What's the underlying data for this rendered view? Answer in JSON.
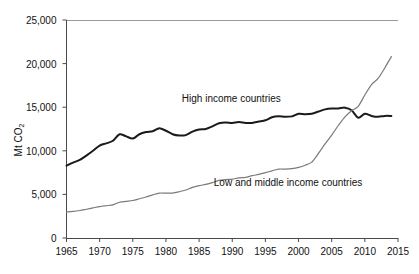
{
  "chart_data": {
    "type": "line",
    "title": "",
    "subtitle": "",
    "xlabel": "",
    "ylabel": "Mt CO",
    "ylabel_sub": "2",
    "xlim": [
      1965,
      2015
    ],
    "ylim": [
      0,
      25000
    ],
    "grid": false,
    "legend_position": "inline-annotations",
    "y_ticks": [
      0,
      5000,
      10000,
      15000,
      20000,
      25000
    ],
    "y_tick_labels": [
      "0",
      "5,000",
      "10,000",
      "15,000",
      "20,000",
      "25,000"
    ],
    "x_ticks": [
      1965,
      1970,
      1975,
      1980,
      1985,
      1990,
      1995,
      2000,
      2005,
      2010,
      2015
    ],
    "x_tick_labels": [
      "1965",
      "1970",
      "1975",
      "1980",
      "1985",
      "1990",
      "1995",
      "2000",
      "2005",
      "2010",
      "2015"
    ],
    "x": [
      1965,
      1966,
      1967,
      1968,
      1969,
      1970,
      1971,
      1972,
      1973,
      1974,
      1975,
      1976,
      1977,
      1978,
      1979,
      1980,
      1981,
      1982,
      1983,
      1984,
      1985,
      1986,
      1987,
      1988,
      1989,
      1990,
      1991,
      1992,
      1993,
      1994,
      1995,
      1996,
      1997,
      1998,
      1999,
      2000,
      2001,
      2002,
      2003,
      2004,
      2005,
      2006,
      2007,
      2008,
      2009,
      2010,
      2011,
      2012,
      2013,
      2014
    ],
    "series": [
      {
        "name": "High income countries",
        "color": "#1a1a1a",
        "width": 2.0,
        "label_x": 1992.2,
        "label_y": 15900,
        "values": [
          8300,
          8650,
          8950,
          9450,
          10000,
          10600,
          10850,
          11150,
          11900,
          11650,
          11400,
          11900,
          12150,
          12250,
          12600,
          12300,
          11900,
          11750,
          11800,
          12200,
          12450,
          12500,
          12800,
          13150,
          13250,
          13200,
          13300,
          13200,
          13200,
          13350,
          13500,
          13850,
          13950,
          13900,
          13950,
          14250,
          14200,
          14250,
          14500,
          14750,
          14850,
          14850,
          14950,
          14650,
          13800,
          14250,
          14000,
          13900,
          14000,
          14000
        ]
      },
      {
        "name": "Low and middle income countries",
        "color": "#7a7a7a",
        "width": 1.2,
        "label_x": 1992.5,
        "label_y": 6300,
        "values": [
          3000,
          3050,
          3150,
          3300,
          3450,
          3600,
          3700,
          3800,
          4100,
          4200,
          4300,
          4500,
          4700,
          4950,
          5150,
          5150,
          5150,
          5300,
          5500,
          5800,
          6000,
          6150,
          6350,
          6600,
          6700,
          6750,
          6900,
          6950,
          7150,
          7300,
          7500,
          7700,
          7900,
          7900,
          7950,
          8100,
          8350,
          8700,
          9700,
          10800,
          11800,
          12900,
          13900,
          14600,
          15100,
          16400,
          17600,
          18300,
          19500,
          20800
        ]
      }
    ]
  },
  "annotations": {
    "high_income_label": "High income countries",
    "low_middle_label": "Low and middle income countries"
  },
  "axes": {
    "y_title_text": "Mt CO",
    "y_title_sub": "2"
  }
}
